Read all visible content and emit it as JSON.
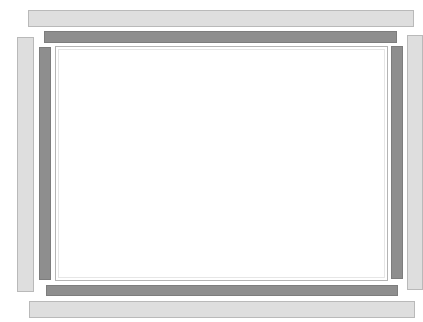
{
  "figure": {
    "colors": {
      "light_bar": "#dedede",
      "light_bar_border": "#b9b9b9",
      "dark_bar": "#8e8e8e",
      "panel": "#ffffff",
      "panel_border": "#b4b4b4"
    },
    "outer_bars": [
      "top",
      "right",
      "bottom",
      "left"
    ],
    "inner_bars": [
      "top",
      "right",
      "bottom",
      "left"
    ]
  }
}
